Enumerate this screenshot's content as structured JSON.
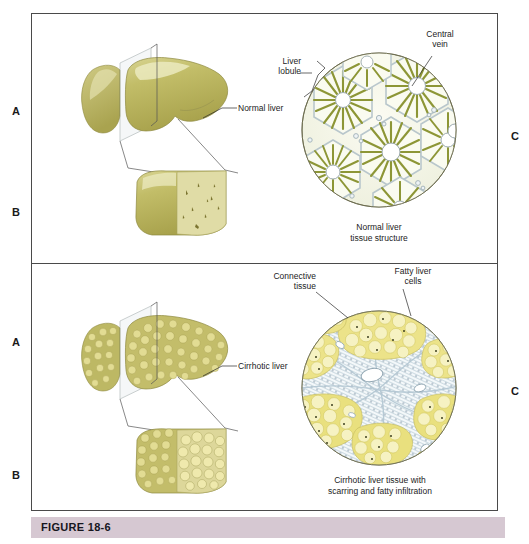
{
  "figure": {
    "caption_label": "FIGURE 18-6",
    "band_color": "#d6c8d2"
  },
  "row_letters": {
    "top_a": "A",
    "top_b": "B",
    "top_c": "C",
    "bottom_a": "A",
    "bottom_b": "B",
    "bottom_c": "C"
  },
  "panels": [
    {
      "id": "normal-liver-panel",
      "organ_label": "Normal liver",
      "tissue_caption": "Normal liver\ntissue structure",
      "annotations": [
        {
          "name": "liver-lobule",
          "text": "Liver\nlobule"
        },
        {
          "name": "central-vein",
          "text": "Central\nvein"
        }
      ]
    },
    {
      "id": "cirrhotic-liver-panel",
      "organ_label": "Cirrhotic liver",
      "tissue_caption": "Cirrhotic liver tissue with\nscarring and fatty infiltration",
      "annotations": [
        {
          "name": "connective-tissue",
          "text": "Connective\ntissue"
        },
        {
          "name": "fatty-liver-cells",
          "text": "Fatty liver\ncells"
        }
      ]
    }
  ],
  "colors": {
    "liver_olive": "#b9b45c",
    "liver_light": "#d4d08a",
    "liver_highlight": "#e8e6bd",
    "cut_face_normal": "#ddd9a4",
    "nodule_yellow": "#e4dc7e",
    "fat_cell_yellow": "#ece48a",
    "connective_blue": "#c7d4dc",
    "sinusoid_green": "#8a9434",
    "frame_gray": "#4a4a4a",
    "vein_white": "#ffffff"
  }
}
